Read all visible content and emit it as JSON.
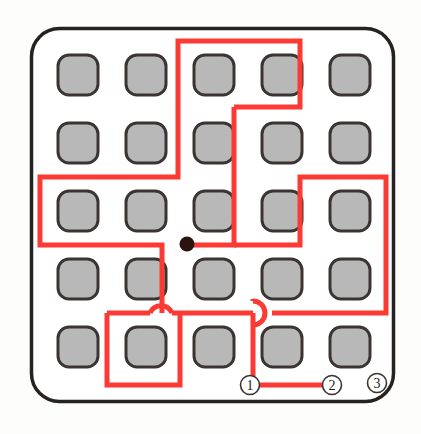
{
  "figure": {
    "background_color": "#fdfdfb",
    "board": {
      "border_color": "#262220",
      "fill_color": "#ffffff",
      "x": 30,
      "y": 27,
      "width": 365,
      "height": 376,
      "corner_radius": 28,
      "stroke_width": 3.5
    },
    "grid": {
      "rows": 5,
      "cols": 5,
      "cell_size": 40,
      "cell_radius": 11,
      "col_x": [
        58,
        126,
        194,
        262,
        330
      ],
      "row_y": [
        55,
        123,
        191,
        259,
        327
      ],
      "cell_fill": "#b8b8b8",
      "cell_stroke": "#3a3432",
      "cell_stroke_width": 3
    },
    "marker_dot": {
      "label": "center-dot",
      "x": 187,
      "y": 244,
      "radius": 7,
      "color": "#2b1410"
    },
    "path": {
      "color": "#fb3b33",
      "stroke_width": 5,
      "segments": [
        "M 262 372 L 262 338 L 262 312",
        "M 228 38 L 228 112 L 160 112 L 160 182 L 36 182 L 36 226 L 160 226 L 160 312",
        "M 228 38 L 296 38 L 296 112 L 228 112",
        "M 228 112 L 228 226 L 296 226 L 296 182 L 388 182 L 388 312 L 262 312",
        "M 187 244 L 228 244",
        "M 105 312 L 105 388 L 228 388 L 228 312",
        "M 36 226 L 160 226"
      ],
      "hops": [
        {
          "cx": 160,
          "cy": 312,
          "r": 13,
          "label": "bridge-hop-left"
        },
        {
          "cx": 262,
          "cy": 312,
          "r": 13,
          "label": "bridge-hop-right"
        }
      ],
      "bottom_run": "M 250 388 L 330 388"
    },
    "endpoint_labels": [
      {
        "id": "label-1",
        "text": "1",
        "x": 250,
        "y": 388,
        "r": 10
      },
      {
        "id": "label-2",
        "text": "2",
        "x": 330,
        "y": 388,
        "r": 10
      },
      {
        "id": "label-3",
        "text": "3",
        "x": 378,
        "y": 386,
        "r": 10
      }
    ],
    "colors": {
      "path_red": "#fb3b33",
      "cell_gray": "#b8b8b8",
      "outline_dark": "#3a3432",
      "dot_dark": "#2b1410"
    }
  }
}
